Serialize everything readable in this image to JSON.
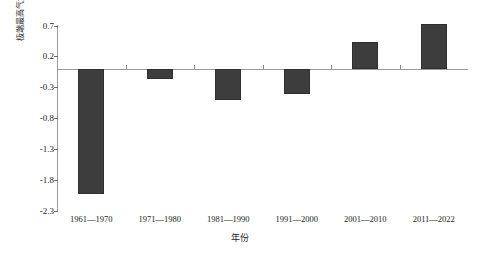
{
  "chart_data": {
    "type": "bar",
    "title": "",
    "xlabel": "年份",
    "ylabel": "极端最高气温距平/°C",
    "categories": [
      "1961—1970",
      "1971—1980",
      "1981—1990",
      "1991—2000",
      "2001—2010",
      "2011—2022"
    ],
    "values": [
      -2.03,
      -0.16,
      -0.51,
      -0.41,
      0.43,
      0.72
    ],
    "series": [
      {
        "name": "极端最高气温距平",
        "values": [
          -2.03,
          -0.16,
          -0.51,
          -0.41,
          0.43,
          0.72
        ]
      }
    ],
    "ylim": [
      -2.3,
      0.7
    ],
    "ytick_values": [
      0.7,
      0.2,
      -0.3,
      -0.8,
      -1.3,
      -1.8,
      -2.3
    ],
    "ytick_labels": [
      "0.7",
      "0.2",
      "-0.3",
      "-0.8",
      "-1.3",
      "-1.8",
      "-2.3"
    ],
    "grid": false,
    "legend": "none",
    "bar_color": "#3d3d3d",
    "axis_color": "#9a9a9a",
    "baseline_value": 0
  }
}
